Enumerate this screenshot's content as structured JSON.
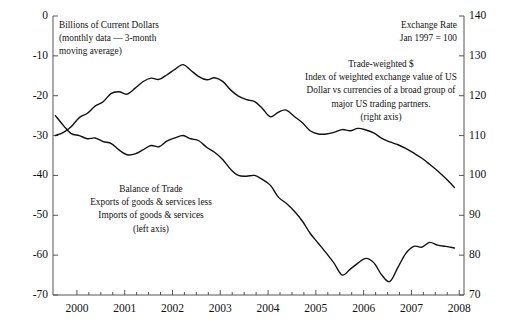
{
  "chart_data": {
    "type": "line",
    "title": "",
    "xlabel": "",
    "x_tick_labels": [
      "2000",
      "2001",
      "2002",
      "2003",
      "2004",
      "2005",
      "2006",
      "2007",
      "2008"
    ],
    "x_range": [
      1999.5,
      2008.1
    ],
    "grid": false,
    "legend_position": "inline-annotations",
    "axes": {
      "left": {
        "label": "Billions of Current Dollars",
        "sublabel": "(monthly data — 3-month moving average)",
        "ticks": [
          0,
          -10,
          -20,
          -30,
          -40,
          -50,
          -60,
          -70
        ],
        "tick_labels": [
          "0",
          "-10",
          "-20",
          "-30",
          "-40",
          "-50",
          "-60",
          "-70"
        ],
        "range": [
          -70,
          0
        ]
      },
      "right": {
        "label": "Exchange Rate",
        "sublabel": "Jan 1997 = 100",
        "ticks": [
          140,
          130,
          120,
          110,
          100,
          90,
          80,
          70
        ],
        "tick_labels": [
          "140",
          "130",
          "120",
          "110",
          "100",
          "90",
          "80",
          "70"
        ],
        "range": [
          70,
          140
        ]
      }
    },
    "series": [
      {
        "name": "Trade-weighted $",
        "axis": "right",
        "color": "#111111",
        "x": [
          1999.55,
          1999.72,
          1999.88,
          2000.05,
          2000.22,
          2000.38,
          2000.55,
          2000.72,
          2000.88,
          2001.05,
          2001.22,
          2001.38,
          2001.55,
          2001.72,
          2001.88,
          2002.05,
          2002.22,
          2002.38,
          2002.55,
          2002.72,
          2002.88,
          2003.05,
          2003.22,
          2003.38,
          2003.55,
          2003.72,
          2003.88,
          2004.05,
          2004.22,
          2004.38,
          2004.55,
          2004.72,
          2004.88,
          2005.05,
          2005.22,
          2005.38,
          2005.55,
          2005.72,
          2005.88,
          2006.05,
          2006.22,
          2006.38,
          2006.55,
          2006.72,
          2006.88,
          2007.05,
          2007.22,
          2007.38,
          2007.55,
          2007.72,
          2007.9
        ],
        "values": [
          110.0,
          110.8,
          112.2,
          114.5,
          115.6,
          117.4,
          118.5,
          120.6,
          121.0,
          120.4,
          121.9,
          123.5,
          124.4,
          124.1,
          125.2,
          126.6,
          127.8,
          126.4,
          124.8,
          124.0,
          124.5,
          123.6,
          121.4,
          119.9,
          119.0,
          118.5,
          116.8,
          114.7,
          115.9,
          116.4,
          114.8,
          113.2,
          111.2,
          110.4,
          110.4,
          110.8,
          111.5,
          111.2,
          111.8,
          111.4,
          110.6,
          109.3,
          108.4,
          107.7,
          106.8,
          105.6,
          104.3,
          102.8,
          101.1,
          99.2,
          97.0
        ]
      },
      {
        "name": "Balance of Trade",
        "axis": "left",
        "color": "#111111",
        "x": [
          1999.55,
          1999.72,
          1999.88,
          2000.05,
          2000.22,
          2000.38,
          2000.55,
          2000.72,
          2000.88,
          2001.05,
          2001.22,
          2001.38,
          2001.55,
          2001.72,
          2001.88,
          2002.05,
          2002.22,
          2002.38,
          2002.55,
          2002.72,
          2002.88,
          2003.05,
          2003.22,
          2003.38,
          2003.55,
          2003.72,
          2003.88,
          2004.05,
          2004.22,
          2004.38,
          2004.55,
          2004.72,
          2004.88,
          2005.05,
          2005.22,
          2005.38,
          2005.55,
          2005.72,
          2005.88,
          2006.05,
          2006.22,
          2006.38,
          2006.55,
          2006.72,
          2006.88,
          2007.05,
          2007.22,
          2007.38,
          2007.55,
          2007.72,
          2007.9
        ],
        "values": [
          -25.0,
          -27.5,
          -29.5,
          -30.0,
          -30.8,
          -30.6,
          -31.5,
          -32.0,
          -33.6,
          -34.8,
          -34.6,
          -33.6,
          -32.5,
          -32.8,
          -31.4,
          -30.6,
          -30.0,
          -30.8,
          -31.3,
          -33.0,
          -34.2,
          -36.0,
          -38.5,
          -40.0,
          -40.2,
          -40.0,
          -41.0,
          -42.5,
          -45.5,
          -47.0,
          -49.0,
          -51.5,
          -54.5,
          -57.0,
          -59.5,
          -62.0,
          -65.0,
          -63.5,
          -62.0,
          -60.8,
          -62.0,
          -65.0,
          -66.6,
          -63.0,
          -59.6,
          -57.8,
          -58.0,
          -56.8,
          -57.5,
          -57.8,
          -58.2
        ]
      }
    ],
    "annotations": [
      {
        "name": "left-axis-caption",
        "lines": [
          "Billions of Current Dollars",
          "(monthly data — 3-month",
          "moving average)"
        ],
        "align": "left"
      },
      {
        "name": "right-axis-caption",
        "lines": [
          "Exchange Rate",
          "Jan 1997 = 100"
        ],
        "align": "right"
      },
      {
        "name": "trade-weighted-dollar-note",
        "lines": [
          "Trade-weighted $",
          "Index of weighted exchange value of US",
          "Dollar vs currencies of a broad group of",
          "major US trading partners.",
          "(right axis)"
        ],
        "align": "center"
      },
      {
        "name": "balance-of-trade-note",
        "lines": [
          "Balance of Trade",
          "Exports of goods & services less",
          "Imports of goods & services",
          "(left axis)"
        ],
        "align": "center"
      }
    ]
  }
}
